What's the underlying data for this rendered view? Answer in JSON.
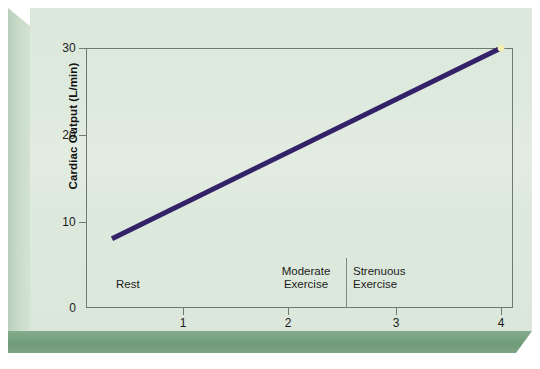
{
  "chart_data": {
    "type": "line",
    "title": "",
    "xlabel": "Exercise Intensity",
    "ylabel": "Cardiac Output (L/min)",
    "xlim": [
      0,
      4.2
    ],
    "ylim": [
      0,
      30
    ],
    "xticks": [
      "1",
      "2",
      "3",
      "4"
    ],
    "xtick_values": [
      1,
      2,
      3,
      4
    ],
    "yticks": [
      "0",
      "10",
      "20",
      "30"
    ],
    "ytick_values": [
      0,
      10,
      20,
      30
    ],
    "grid": false,
    "legend": null,
    "series": [
      {
        "name": "Cardiac Output",
        "color": "#342268",
        "x": [
          0.33,
          4.0
        ],
        "values": [
          8.0,
          30.0
        ],
        "linewidth": 5,
        "endpoint_marker": {
          "x": 4.0,
          "y": 30.0,
          "color": "#f2edb0"
        }
      }
    ],
    "annotations": [
      {
        "text": "Rest",
        "x": 0.35,
        "y": 3.6
      },
      {
        "text": "Moderate\nExercise",
        "x": 2.0,
        "y": 5.2
      },
      {
        "text": "Strenuous\nExercise",
        "x": 3.0,
        "y": 5.2
      }
    ],
    "zone_divider_x": 2.35
  },
  "axes": {
    "y_title": "Cardiac Output (L/min)",
    "x_title": "Exercise Intensity",
    "y_ticks": [
      {
        "label": "30",
        "top": 33
      },
      {
        "label": "20",
        "top": 120
      },
      {
        "label": "10",
        "top": 207
      },
      {
        "label": "0",
        "top": 293
      }
    ],
    "y_tick_marks": [
      40,
      127,
      214,
      300
    ],
    "x_ticks": [
      {
        "label": "1",
        "left": 160
      },
      {
        "label": "2",
        "left": 265
      },
      {
        "label": "3",
        "left": 373
      },
      {
        "label": "4",
        "left": 478
      }
    ],
    "x_tick_marks": [
      175,
      280,
      388,
      493
    ]
  },
  "zones": {
    "rest": "Rest",
    "moderate_line1": "Moderate",
    "moderate_line2": "Exercise",
    "strenuous_line1": "Strenuous",
    "strenuous_line2": "Exercise"
  },
  "colors": {
    "background": "#dde8dc",
    "line": "#342268",
    "frame": "#6d7a6d",
    "bevel_bottom": "#6f9b79",
    "bevel_left": "#c9dbc9",
    "marker": "#f2edb0"
  }
}
